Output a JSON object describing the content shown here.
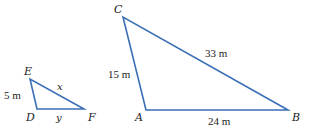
{
  "diagram": {
    "colors": {
      "line": "#3b6fb6",
      "text": "#222222",
      "background": "#ffffff"
    },
    "triangles": [
      {
        "name": "DEF",
        "vertices": {
          "E": {
            "label": "E",
            "x": 30,
            "y": 79
          },
          "D": {
            "label": "D",
            "x": 37,
            "y": 109
          },
          "F": {
            "label": "F",
            "x": 84,
            "y": 109
          }
        },
        "sides": {
          "DE": {
            "label": "5 m"
          },
          "EF": {
            "label": "x"
          },
          "DF": {
            "label": "y"
          }
        }
      },
      {
        "name": "ABC",
        "vertices": {
          "C": {
            "label": "C",
            "x": 123,
            "y": 17
          },
          "A": {
            "label": "A",
            "x": 146,
            "y": 110
          },
          "B": {
            "label": "B",
            "x": 288,
            "y": 110
          }
        },
        "sides": {
          "AC": {
            "label": "15 m"
          },
          "BC": {
            "label": "33 m"
          },
          "AB": {
            "label": "24 m"
          }
        }
      }
    ]
  }
}
